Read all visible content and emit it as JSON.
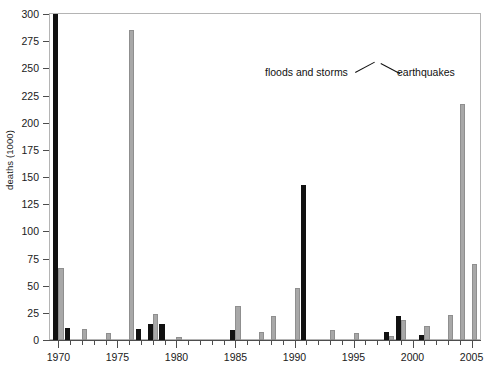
{
  "chart_data": {
    "type": "bar",
    "title": "",
    "xlabel": "",
    "ylabel": "deaths (1000)",
    "ylim": [
      0,
      300
    ],
    "xlim": [
      1969.2,
      2005.8
    ],
    "ytick_step": 25,
    "grid": false,
    "legend_position": "inline-annotation",
    "yticks": [
      "0",
      "25",
      "50",
      "75",
      "100",
      "125",
      "150",
      "175",
      "200",
      "225",
      "250",
      "275",
      "300"
    ],
    "xticks_major": [
      "1970",
      "1975",
      "1980",
      "1985",
      "1990",
      "1995",
      "2000",
      "2005"
    ],
    "xticks_minor_step": 1,
    "annotations": [
      {
        "text": "floods and storms",
        "points_to": "black-bar-1998"
      },
      {
        "text": "earthquakes",
        "points_to": "gray-bar-1998"
      }
    ],
    "colors": {
      "floods_and_storms": "#111111",
      "earthquakes": "#a8a8a8"
    },
    "x": [
      1970,
      1971,
      1972,
      1974,
      1976,
      1977,
      1978,
      1979,
      1980,
      1985,
      1987,
      1988,
      1990,
      1991,
      1993,
      1995,
      1998,
      1999,
      2001,
      2003,
      2004,
      2005
    ],
    "series": [
      {
        "name": "floods and storms",
        "color": "#111111",
        "values": [
          300,
          11,
          0,
          0,
          0,
          10,
          15,
          15,
          0,
          9,
          0,
          0,
          0,
          143,
          0,
          0,
          7,
          22,
          5,
          0,
          0,
          0
        ]
      },
      {
        "name": "earthquakes",
        "color": "#a8a8a8",
        "values": [
          66,
          0,
          10,
          6,
          285,
          0,
          24,
          0,
          3,
          31,
          7,
          22,
          48,
          0,
          9,
          6,
          4,
          18,
          13,
          23,
          217,
          70
        ]
      }
    ]
  },
  "axis": {
    "ylabel": "deaths (1000)"
  }
}
